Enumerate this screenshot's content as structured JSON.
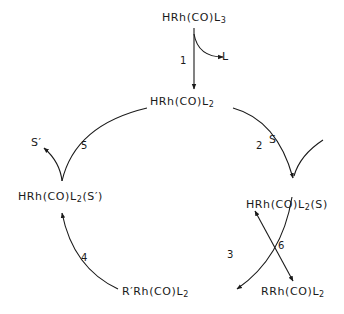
{
  "diagram": {
    "type": "catalytic-cycle",
    "species": {
      "start": {
        "base": "HRh(CO)L",
        "sub": "3",
        "tail": ""
      },
      "top": {
        "base": "HRh(CO)L",
        "sub": "2",
        "tail": ""
      },
      "right": {
        "base": "HRh(CO)L",
        "sub": "2",
        "tail": "(S)"
      },
      "bottom": {
        "pre": "R′Rh(CO)L",
        "sub": "2"
      },
      "left": {
        "base": "HRh(CO)L",
        "sub": "2",
        "tail": "(S′)"
      },
      "side": {
        "base": "RRh(CO)L",
        "sub": "2"
      }
    },
    "reagents": {
      "L": "L",
      "S": "S",
      "S_prime": "S′"
    },
    "steps": [
      "1",
      "2",
      "3",
      "4",
      "5",
      "6"
    ]
  }
}
